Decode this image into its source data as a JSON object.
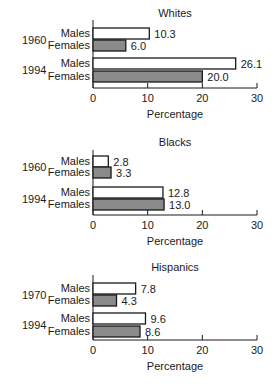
{
  "colors": {
    "male_fill": "#ffffff",
    "female_fill": "#8a8a8a",
    "stroke": "#1a1a1a"
  },
  "chart_data": [
    {
      "type": "bar",
      "orientation": "horizontal",
      "title": "Whites",
      "xlabel": "Percentage",
      "xlim": [
        0,
        30
      ],
      "xticks": [
        0,
        10,
        20,
        30
      ],
      "groups": [
        {
          "year": "1960",
          "bars": [
            {
              "label": "Males",
              "value": 10.3,
              "display": "10.3"
            },
            {
              "label": "Females",
              "value": 6.0,
              "display": "6.0"
            }
          ]
        },
        {
          "year": "1994",
          "bars": [
            {
              "label": "Males",
              "value": 26.1,
              "display": "26.1"
            },
            {
              "label": "Females",
              "value": 20.0,
              "display": "20.0"
            }
          ]
        }
      ]
    },
    {
      "type": "bar",
      "orientation": "horizontal",
      "title": "Blacks",
      "xlabel": "Percentage",
      "xlim": [
        0,
        30
      ],
      "xticks": [
        0,
        10,
        20,
        30
      ],
      "groups": [
        {
          "year": "1960",
          "bars": [
            {
              "label": "Males",
              "value": 2.8,
              "display": "2.8"
            },
            {
              "label": "Females",
              "value": 3.3,
              "display": "3.3"
            }
          ]
        },
        {
          "year": "1994",
          "bars": [
            {
              "label": "Males",
              "value": 12.8,
              "display": "12.8"
            },
            {
              "label": "Females",
              "value": 13.0,
              "display": "13.0"
            }
          ]
        }
      ]
    },
    {
      "type": "bar",
      "orientation": "horizontal",
      "title": "Hispanics",
      "xlabel": "Percentage",
      "xlim": [
        0,
        30
      ],
      "xticks": [
        0,
        10,
        20,
        30
      ],
      "groups": [
        {
          "year": "1970",
          "bars": [
            {
              "label": "Males",
              "value": 7.8,
              "display": "7.8"
            },
            {
              "label": "Females",
              "value": 4.3,
              "display": "4.3"
            }
          ]
        },
        {
          "year": "1994",
          "bars": [
            {
              "label": "Males",
              "value": 9.6,
              "display": "9.6"
            },
            {
              "label": "Females",
              "value": 8.6,
              "display": "8.6"
            }
          ]
        }
      ]
    }
  ]
}
